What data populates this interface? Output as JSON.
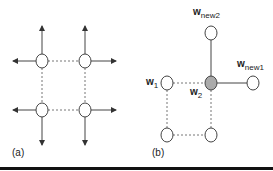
{
  "panels": {
    "a": {
      "label": "(a)"
    },
    "b": {
      "label": "(b)",
      "w1": {
        "base": "w",
        "sub": "1"
      },
      "w2": {
        "base": "w",
        "sub": "2"
      },
      "wnew1": {
        "base": "w",
        "sub": "new1"
      },
      "wnew2": {
        "base": "w",
        "sub": "new2"
      }
    }
  },
  "colors": {
    "line": "#444444",
    "dotted": "#777777",
    "highlight": "#aaaaaa"
  }
}
